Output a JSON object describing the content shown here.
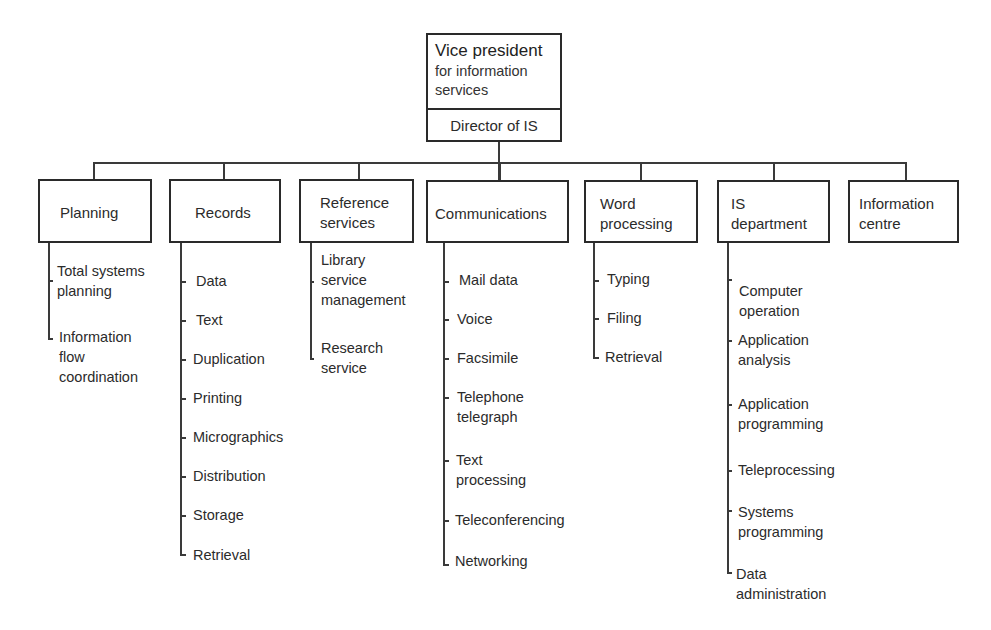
{
  "chart": {
    "top": {
      "title": "Vice president",
      "subtitle": "for information\nservices",
      "director": "Director of IS"
    },
    "departments": [
      {
        "label": "Planning",
        "items": [
          "Total systems\nplanning",
          "Information\nflow\ncoordination"
        ]
      },
      {
        "label": "Records",
        "items": [
          "Data",
          "Text",
          "Duplication",
          "Printing",
          "Micrographics",
          "Distribution",
          "Storage",
          "Retrieval"
        ]
      },
      {
        "label": "Reference\nservices",
        "items": [
          "Library\nservice\nmanagement",
          "Research\nservice"
        ]
      },
      {
        "label": "Communications",
        "items": [
          "Mail data",
          "Voice",
          "Facsimile",
          "Telephone\ntelegraph",
          "Text\nprocessing",
          "Teleconferencing",
          "Networking"
        ]
      },
      {
        "label": "Word\nprocessing",
        "items": [
          "Typing",
          "Filing",
          "Retrieval"
        ]
      },
      {
        "label": "IS\ndepartment",
        "items": [
          "Computer\noperation",
          "Application\nanalysis",
          "Application\nprogramming",
          "Teleprocessing",
          "Systems\nprogramming",
          "Data\nadministration"
        ]
      },
      {
        "label": "Information\ncentre",
        "items": []
      }
    ]
  }
}
